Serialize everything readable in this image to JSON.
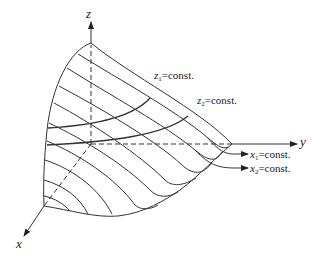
{
  "diagram": {
    "axes": {
      "x_label": "x",
      "y_label": "y",
      "z_label": "z"
    },
    "annotations": {
      "z1": {
        "var": "z",
        "sub": "1",
        "text": "=const."
      },
      "z2": {
        "var": "z",
        "sub": "2",
        "text": "=const."
      },
      "x1": {
        "var": "x",
        "sub": "1",
        "text": "=const."
      },
      "x2": {
        "var": "x",
        "sub": "2",
        "text": "=const."
      }
    },
    "colors": {
      "stroke": "#333333",
      "background": "#ffffff"
    }
  }
}
